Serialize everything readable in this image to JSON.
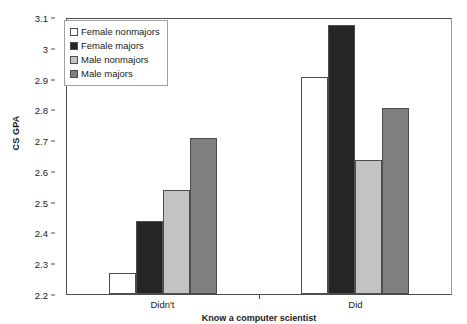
{
  "chart_data": {
    "type": "bar",
    "title": "",
    "subtitle": "",
    "xlabel": "Know a computer scientist",
    "ylabel": "CS GPA",
    "categories": [
      "Didn't",
      "Did"
    ],
    "series": [
      {
        "name": "Female nonmajors",
        "color": "#ffffff",
        "values": [
          2.27,
          2.91
        ]
      },
      {
        "name": "Female majors",
        "color": "#262626",
        "values": [
          2.44,
          3.08
        ]
      },
      {
        "name": "Male nonmajors",
        "color": "#c3c3c3",
        "values": [
          2.54,
          2.64
        ]
      },
      {
        "name": "Male majors",
        "color": "#7f7f7f",
        "values": [
          2.71,
          2.81
        ]
      }
    ],
    "ylim": [
      2.2,
      3.1
    ],
    "yticks": [
      2.2,
      2.3,
      2.4,
      2.5,
      2.6,
      2.7,
      2.8,
      2.9,
      3.0,
      3.1
    ],
    "ytick_labels": [
      "2.2",
      "2.3",
      "2.4",
      "2.5",
      "2.6",
      "2.7",
      "2.8",
      "2.9",
      "3",
      "3.1"
    ],
    "grid": false,
    "legend_position": "top-left",
    "bar_border_color": "#4d4d4d",
    "axis_color": "#4d4d4d",
    "plot_background": "#ffffff"
  },
  "legend": {
    "items": [
      {
        "label": "Female nonmajors"
      },
      {
        "label": "Female majors"
      },
      {
        "label": "Male nonmajors"
      },
      {
        "label": "Male majors"
      }
    ]
  },
  "axes": {
    "y_title": "CS GPA",
    "x_title": "Know a computer scientist"
  }
}
